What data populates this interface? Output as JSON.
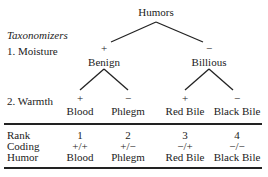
{
  "tree": {
    "root": "Humors",
    "row_heading": "Taxonomizers",
    "levels": [
      {
        "label": "1. Moisture"
      },
      {
        "label": "2. Warmth"
      }
    ],
    "moisture_nodes": [
      {
        "sign": "+",
        "name": "Benign"
      },
      {
        "sign": "−",
        "name": "Billious"
      }
    ],
    "warmth_nodes": [
      {
        "sign": "+",
        "name": "Blood"
      },
      {
        "sign": "−",
        "name": "Phlegm"
      },
      {
        "sign": "+",
        "name": "Red Bile"
      },
      {
        "sign": "−",
        "name": "Black Bile"
      }
    ]
  },
  "table": {
    "row_labels": [
      "Rank",
      "Coding",
      "Humor"
    ],
    "columns": [
      {
        "rank": "1",
        "coding": "+/+",
        "humor": "Blood"
      },
      {
        "rank": "2",
        "coding": "+/−",
        "humor": "Phlegm"
      },
      {
        "rank": "3",
        "coding": "−/+",
        "humor": "Red Bile"
      },
      {
        "rank": "4",
        "coding": "−/−",
        "humor": "Black Bile"
      }
    ]
  }
}
